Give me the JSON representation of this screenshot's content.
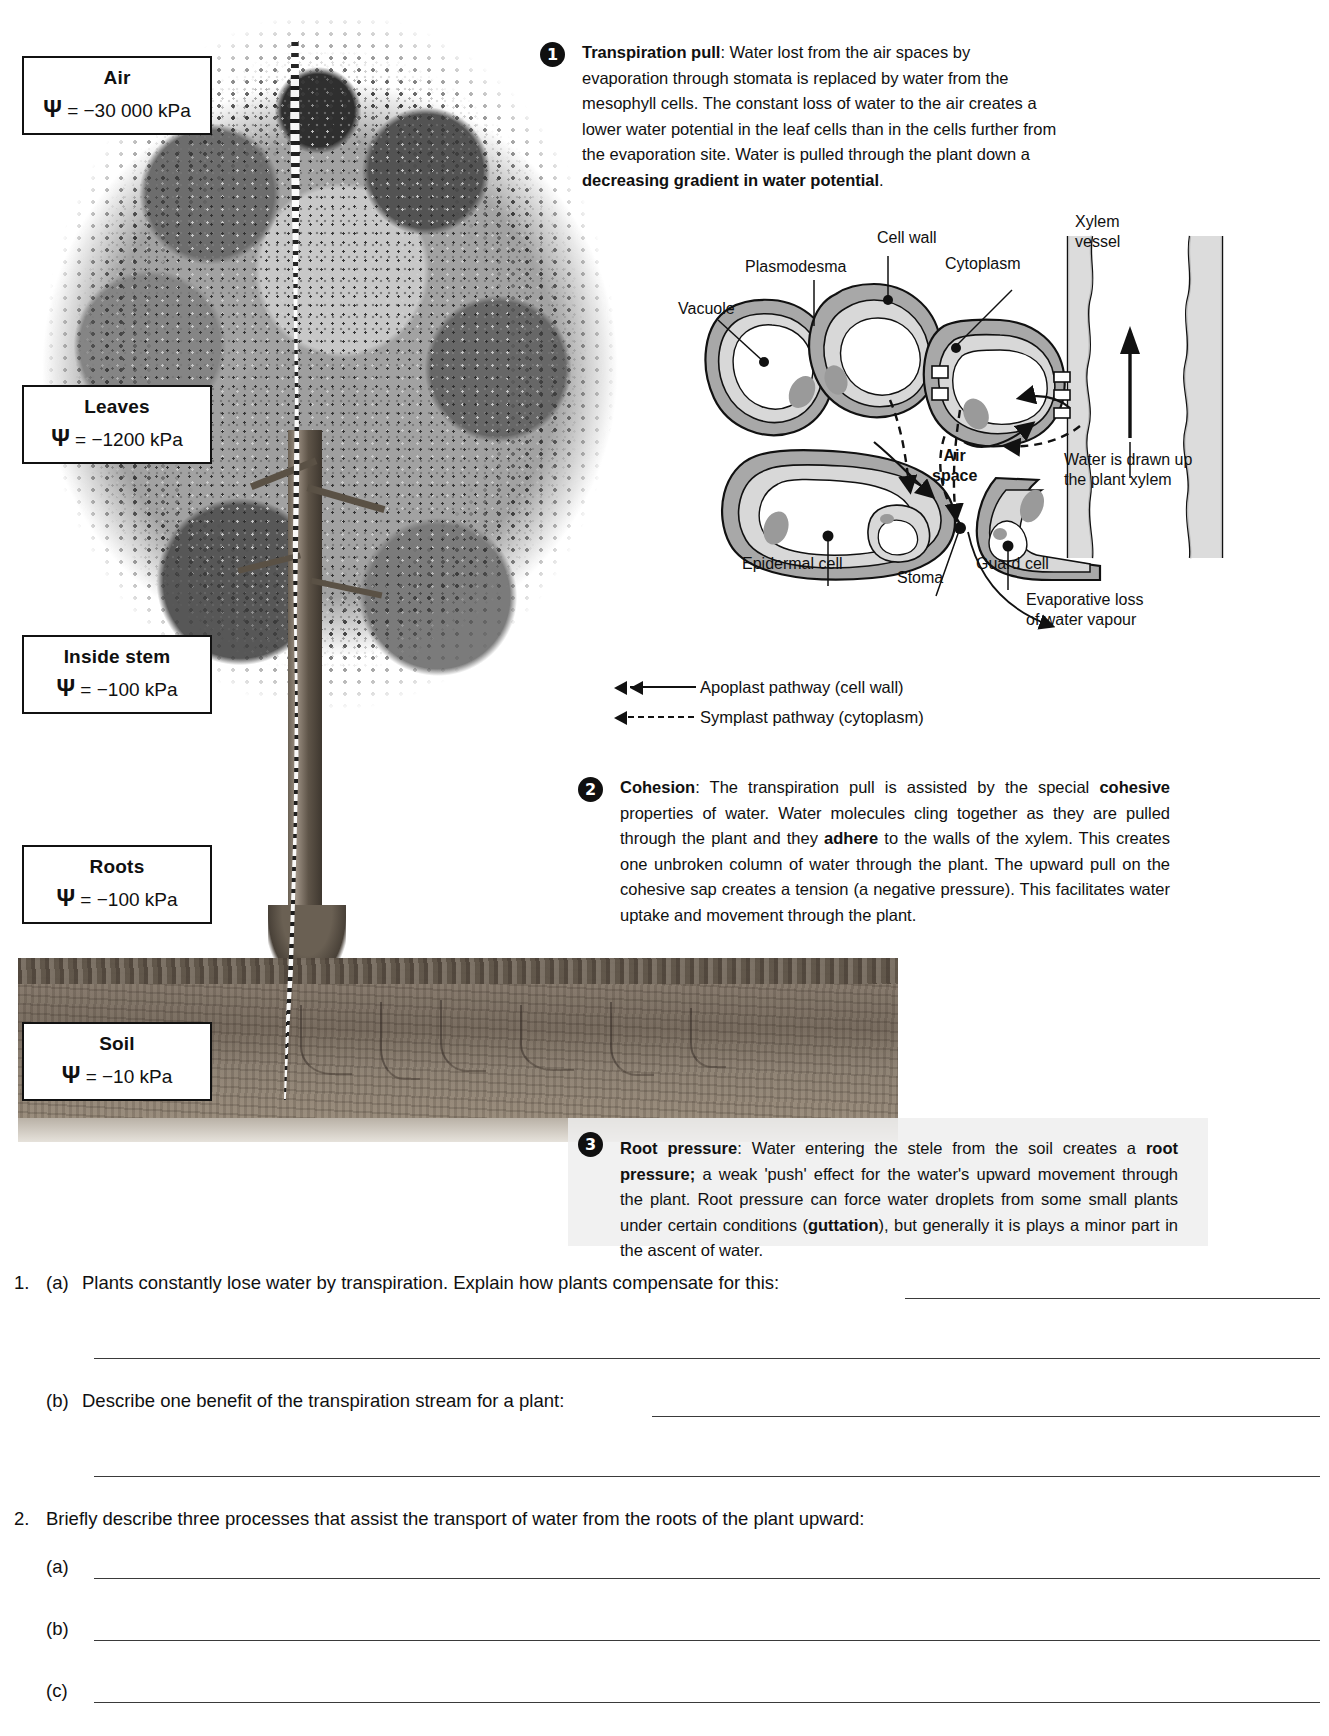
{
  "figure": {
    "potential_boxes": [
      {
        "name": "air",
        "title": "Air",
        "value": "= −30 000 kPa",
        "symbol": "Ψ"
      },
      {
        "name": "leaves",
        "title": "Leaves",
        "value": "= −1200 kPa",
        "symbol": "Ψ"
      },
      {
        "name": "stem",
        "title": "Inside stem",
        "value": "= −100 kPa",
        "symbol": "Ψ"
      },
      {
        "name": "roots",
        "title": "Roots",
        "value": "= −100 kPa",
        "symbol": "Ψ"
      },
      {
        "name": "soil",
        "title": "Soil",
        "value": "= −10 kPa",
        "symbol": "Ψ"
      }
    ],
    "blocks": [
      {
        "number": "1",
        "heading": "Transpiration pull",
        "body_html": "<b>Transpiration pull</b>:  Water lost from the air spaces by evaporation through stomata is replaced by water from the mesophyll cells. The constant loss of water to the air creates a lower water potential in the leaf cells than in the cells further from the evaporation site. Water is pulled through the plant down a <b>decreasing gradient in water potential</b>."
      },
      {
        "number": "2",
        "heading": "Cohesion",
        "body_html": "<b>Cohesion</b>:  The transpiration pull is assisted by the special <b>cohesive</b> properties of water. Water molecules cling together as they are pulled through the plant and they <b>adhere</b> to the walls of the xylem. This creates one unbroken column of water through the plant. The upward pull on the cohesive sap creates a tension (a negative pressure). This facilitates water uptake and movement through the plant."
      },
      {
        "number": "3",
        "heading": "Root pressure",
        "body_html": "<b>Root pressure</b>:  Water entering the stele from the soil creates a <b>root pressure;</b> a weak 'push' effect for the water's upward movement through the plant. Root pressure can force water droplets from some small plants under certain conditions (<b>guttation</b>), but generally it is plays a minor part in the ascent of water."
      }
    ],
    "cell_diagram_labels": [
      {
        "name": "cell-wall",
        "text": "Cell wall"
      },
      {
        "name": "cytoplasm",
        "text": "Cytoplasm"
      },
      {
        "name": "plasmodesma",
        "text": "Plasmodesma"
      },
      {
        "name": "vacuole",
        "text": "Vacuole"
      },
      {
        "name": "xylem-vessel",
        "text": "Xylem\nvessel"
      },
      {
        "name": "air-space",
        "text": "Air\nspace"
      },
      {
        "name": "epidermal-cell",
        "text": "Epidermal cell"
      },
      {
        "name": "stoma",
        "text": "Stoma"
      },
      {
        "name": "guard-cell",
        "text": "Guard cell"
      },
      {
        "name": "water-drawn-up",
        "text": "Water is drawn up\nthe plant xylem"
      },
      {
        "name": "evaporative-loss",
        "text": "Evaporative loss\nof water vapour"
      }
    ],
    "cell_labels_flat": {
      "cell_wall": "Cell wall",
      "cytoplasm": "Cytoplasm",
      "plasmodesma": "Plasmodesma",
      "vacuole": "Vacuole",
      "xylem_vessel_line1": "Xylem",
      "xylem_vessel_line2": "vessel",
      "air_space_line1": "Air",
      "air_space_line2": "space",
      "epidermal_cell": "Epidermal cell",
      "stoma": "Stoma",
      "guard_cell": "Guard cell",
      "water_drawn_line1": "Water is drawn up",
      "water_drawn_line2": "the plant xylem",
      "evaporative_line1": "Evaporative loss",
      "evaporative_line2": "of water vapour"
    },
    "legend": [
      {
        "name": "apoplast",
        "style": "solid-double-arrow",
        "text": "Apoplast pathway (cell wall)"
      },
      {
        "name": "symplast",
        "style": "dashed-arrow",
        "text": "Symplast pathway (cytoplasm)"
      }
    ]
  },
  "questions": [
    {
      "number": "1.",
      "parts": [
        {
          "label": "(a)",
          "text": "Plants constantly lose water by transpiration. Explain how plants compensate for this:",
          "answer_lines": 2
        },
        {
          "label": "(b)",
          "text": "Describe one benefit of the transpiration stream for a plant:",
          "answer_lines": 2
        }
      ]
    },
    {
      "number": "2.",
      "stem": "Briefly describe three processes that assist the transport of water from the roots of the plant upward:",
      "parts": [
        {
          "label": "(a)",
          "text": "",
          "answer_lines": 1
        },
        {
          "label": "(b)",
          "text": "",
          "answer_lines": 1
        },
        {
          "label": "(c)",
          "text": "",
          "answer_lines": 1
        }
      ]
    }
  ],
  "questions_flat": {
    "q1_num": "1.",
    "q1a_label": "(a)",
    "q1a_text": "Plants constantly lose water by transpiration. Explain how plants compensate for this:",
    "q1b_label": "(b)",
    "q1b_text": "Describe one benefit of the transpiration stream for a plant:",
    "q2_num": "2.",
    "q2_text": "Briefly describe three processes that assist the transport of water from the roots of the plant upward:",
    "q2a_label": "(a)",
    "q2b_label": "(b)",
    "q2c_label": "(c)"
  },
  "colors": {
    "ink": "#101010",
    "rule": "#3a3a3a",
    "cell_wall_fill": "#a8a8a8",
    "cytoplasm_fill": "#d8d8d8",
    "vacuole_fill": "#ffffff",
    "badge_bg": "#101010",
    "block3_panel": "#eeeeee"
  }
}
